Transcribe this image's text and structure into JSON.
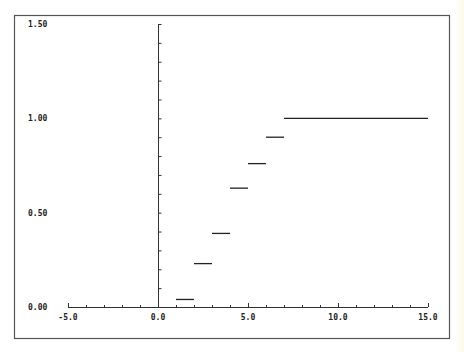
{
  "chart_data": {
    "type": "line",
    "subtype": "step",
    "title": "",
    "xlabel": "",
    "ylabel": "",
    "xlim": [
      -5.0,
      15.0
    ],
    "ylim": [
      0.0,
      1.5
    ],
    "x_ticks": [
      "-5.0",
      "0.0",
      "5.0",
      "10.0",
      "15.0"
    ],
    "x_tick_values": [
      -5,
      0,
      5,
      10,
      15
    ],
    "x_minor_step": 1,
    "y_ticks": [
      "0.00",
      "0.50",
      "1.00",
      "1.50"
    ],
    "y_tick_values": [
      0,
      0.5,
      1.0,
      1.5
    ],
    "y_minor_step": 0.1,
    "grid": false,
    "legend": null,
    "series": [
      {
        "name": "step-function",
        "color": "#222222",
        "segments": [
          {
            "x0": 1,
            "x1": 2,
            "y": 0.04
          },
          {
            "x0": 2,
            "x1": 3,
            "y": 0.23
          },
          {
            "x0": 3,
            "x1": 4,
            "y": 0.39
          },
          {
            "x0": 4,
            "x1": 5,
            "y": 0.63
          },
          {
            "x0": 5,
            "x1": 6,
            "y": 0.76
          },
          {
            "x0": 6,
            "x1": 7,
            "y": 0.9
          },
          {
            "x0": 7,
            "x1": 15,
            "y": 1.0
          }
        ]
      }
    ]
  },
  "frame_color": "#555555",
  "axis_color": "#333333"
}
